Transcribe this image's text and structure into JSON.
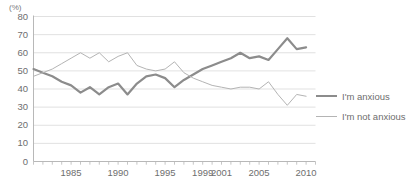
{
  "chart_data": {
    "type": "line",
    "title": "",
    "subtitle": "",
    "xlabel": "",
    "ylabel": "",
    "unit_label": "(%)",
    "ylim": [
      0,
      80
    ],
    "y_ticks": [
      0,
      10,
      20,
      30,
      40,
      50,
      60,
      70,
      80
    ],
    "y_tick_labels": [
      "0",
      "10",
      "20",
      "30",
      "40",
      "50",
      "60",
      "70",
      "80"
    ],
    "xlim": [
      1981,
      2011
    ],
    "x_tick_labels": [
      "1985",
      "1990",
      "1995",
      "1999",
      "2001",
      "2005",
      "2010"
    ],
    "x_tick_values": [
      1985,
      1990,
      1995,
      1999,
      2001,
      2005,
      2010
    ],
    "x_minor_ticks_every": 1,
    "grid": "horizontal",
    "legend_position": "right",
    "x": [
      1981,
      1982,
      1983,
      1984,
      1985,
      1986,
      1987,
      1988,
      1989,
      1990,
      1991,
      1992,
      1993,
      1994,
      1995,
      1996,
      1997,
      1998,
      1999,
      2000,
      2001,
      2002,
      2003,
      2004,
      2005,
      2006,
      2007,
      2008,
      2009,
      2010
    ],
    "series": [
      {
        "name": "I'm anxious",
        "color": "#8c8c8c",
        "width": 2.2,
        "values": [
          51,
          49,
          47,
          44,
          42,
          38,
          41,
          37,
          41,
          43,
          37,
          43,
          47,
          48,
          46,
          41,
          45,
          48,
          51,
          53,
          55,
          57,
          60,
          57,
          58,
          56,
          62,
          68,
          62,
          63
        ]
      },
      {
        "name": "I'm not anxious",
        "color": "#b4b4b4",
        "width": 1,
        "values": [
          47,
          49,
          51,
          54,
          57,
          60,
          57,
          60,
          55,
          58,
          60,
          53,
          51,
          50,
          51,
          55,
          49,
          46,
          44,
          42,
          41,
          40,
          41,
          41,
          40,
          44,
          37,
          31,
          37,
          36
        ]
      }
    ]
  },
  "legend": {
    "items": [
      {
        "label": "I'm anxious"
      },
      {
        "label": "I'm not anxious"
      }
    ]
  }
}
